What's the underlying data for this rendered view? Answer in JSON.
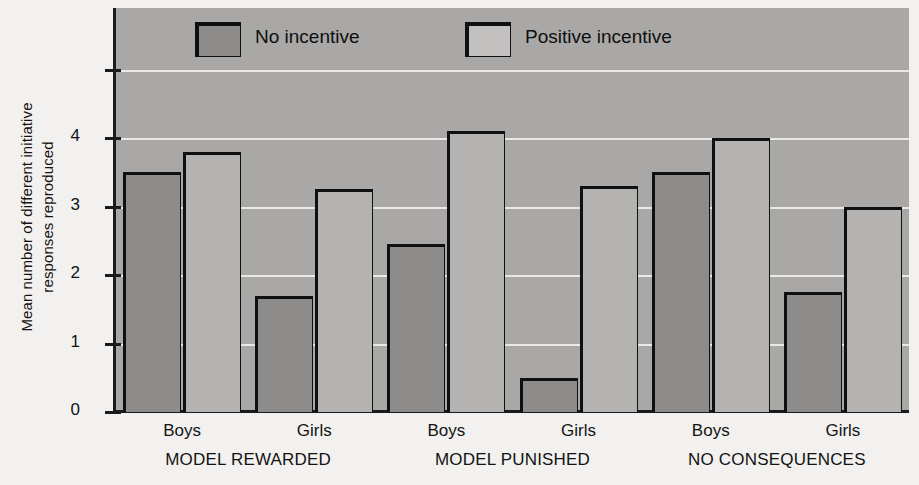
{
  "chart_data": {
    "type": "bar",
    "title": "",
    "xlabel": "",
    "ylabel": "Mean number of different initiative responses reproduced",
    "ylabel_line1": "Mean number of different initiative",
    "ylabel_line2": "responses reproduced",
    "ylim": [
      0,
      5.9
    ],
    "yticks": [
      0,
      1,
      2,
      3,
      4
    ],
    "ytick_labels": [
      "0",
      "1",
      "2",
      "3",
      "4"
    ],
    "grid": true,
    "grid_orientation": "horizontal",
    "legend_position": "top-inside",
    "categories": [
      "Boys",
      "Girls",
      "Boys",
      "Girls",
      "Boys",
      "Girls"
    ],
    "groups": [
      {
        "label": "MODEL REWARDED",
        "categories": [
          "Boys",
          "Girls"
        ]
      },
      {
        "label": "MODEL PUNISHED",
        "categories": [
          "Boys",
          "Girls"
        ]
      },
      {
        "label": "NO CONSEQUENCES",
        "categories": [
          "Boys",
          "Girls"
        ]
      }
    ],
    "series": [
      {
        "name": "No incentive",
        "color": "#8d8c8a",
        "values": [
          3.5,
          1.7,
          2.45,
          0.5,
          3.5,
          1.75
        ]
      },
      {
        "name": "Positive incentive",
        "color": "#b4b3b1",
        "values": [
          3.8,
          3.25,
          4.1,
          3.3,
          4.0,
          3.0
        ]
      }
    ],
    "legend": [
      {
        "label": "No incentive",
        "swatch": "#8d8c8a"
      },
      {
        "label": "Positive incentive",
        "swatch": "#c2c1bf"
      }
    ],
    "colors": {
      "plot_background": "#a9a8a6",
      "page_background": "#f2f1ef",
      "gridline": "#f0efed",
      "outline": "#101010",
      "text": "#131313"
    }
  }
}
